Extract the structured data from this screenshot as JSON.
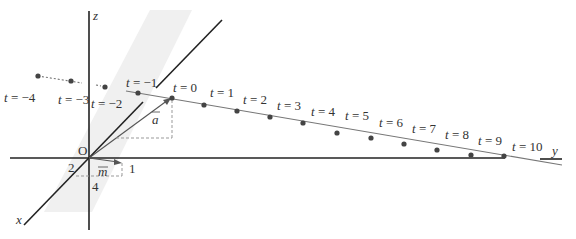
{
  "diagram": {
    "type": "3d-vector-line",
    "colors": {
      "axis": "#222222",
      "line": "#777777",
      "point": "#444444",
      "plane": "#f0f0f0",
      "guide": "#999999"
    },
    "axes": {
      "x_label": "x",
      "y_label": "y",
      "z_label": "z",
      "origin_label": "O"
    },
    "vectors": {
      "a_label": "a",
      "m_label": "m"
    },
    "m_components": {
      "x": "2",
      "y": "1",
      "z": "4"
    },
    "points": [
      {
        "t": "t = −4",
        "x": 38,
        "y": 76,
        "lx": 4,
        "ly": 102
      },
      {
        "t": "t = −3",
        "x": 71,
        "y": 81,
        "lx": 58,
        "ly": 104
      },
      {
        "t": "t = −2",
        "x": 105,
        "y": 87,
        "lx": 91,
        "ly": 108
      },
      {
        "t": "t = −1",
        "x": 138,
        "y": 93,
        "lx": 126,
        "ly": 87
      },
      {
        "t": "t = 0",
        "x": 172,
        "y": 98,
        "lx": 173,
        "ly": 92
      },
      {
        "t": "t = 1",
        "x": 204,
        "y": 105,
        "lx": 210,
        "ly": 97
      },
      {
        "t": "t = 2",
        "x": 237,
        "y": 111,
        "lx": 243,
        "ly": 104
      },
      {
        "t": "t = 3",
        "x": 270,
        "y": 117,
        "lx": 277,
        "ly": 110
      },
      {
        "t": "t = 4",
        "x": 303,
        "y": 123,
        "lx": 311,
        "ly": 116
      },
      {
        "t": "t = 5",
        "x": 337,
        "y": 133,
        "lx": 345,
        "ly": 120
      },
      {
        "t": "t = 6",
        "x": 371,
        "y": 138,
        "lx": 379,
        "ly": 127
      },
      {
        "t": "t = 7",
        "x": 404,
        "y": 144,
        "lx": 412,
        "ly": 133
      },
      {
        "t": "t = 8",
        "x": 437,
        "y": 150,
        "lx": 445,
        "ly": 139
      },
      {
        "t": "t = 9",
        "x": 471,
        "y": 155,
        "lx": 478,
        "ly": 145
      },
      {
        "t": "t = 10",
        "x": 504,
        "y": 156,
        "lx": 512,
        "ly": 151
      }
    ]
  }
}
